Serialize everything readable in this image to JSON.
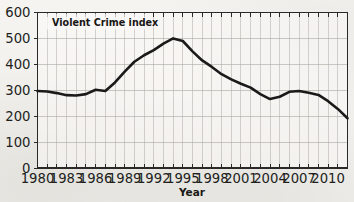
{
  "chart_data": {
    "type": "line",
    "title": "Violent Crime index",
    "xlabel": "Year",
    "ylabel": "",
    "xlim": [
      1980,
      2012
    ],
    "ylim": [
      0,
      600
    ],
    "grid": true,
    "legend_position": "inside-top-left",
    "y_ticks": [
      "0",
      "100",
      "200",
      "300",
      "400",
      "500",
      "600"
    ],
    "y_tick_values": [
      0,
      100,
      200,
      300,
      400,
      500,
      600
    ],
    "x_ticks": [
      "1980",
      "1983",
      "1986",
      "1989",
      "1992",
      "1995",
      "1998",
      "2001",
      "2004",
      "2007",
      "2010"
    ],
    "x_tick_values": [
      1980,
      1983,
      1986,
      1989,
      1992,
      1995,
      1998,
      2001,
      2004,
      2007,
      2010
    ],
    "x_minor_interval": 1,
    "line_color": "#1a1a1a",
    "line_width_px": 2.6,
    "series": [
      {
        "name": "Violent Crime index",
        "x": [
          1980,
          1981,
          1982,
          1983,
          1984,
          1985,
          1986,
          1987,
          1988,
          1989,
          1990,
          1991,
          1992,
          1993,
          1994,
          1995,
          1996,
          1997,
          1998,
          1999,
          2000,
          2001,
          2002,
          2003,
          2004,
          2005,
          2006,
          2007,
          2008,
          2009,
          2010,
          2011,
          2012
        ],
        "values": [
          297,
          295,
          289,
          281,
          280,
          285,
          302,
          297,
          330,
          372,
          410,
          435,
          455,
          480,
          500,
          490,
          450,
          415,
          390,
          362,
          342,
          325,
          310,
          285,
          266,
          275,
          294,
          297,
          290,
          282,
          258,
          228,
          192
        ]
      }
    ]
  },
  "labels": {
    "series_title": "Violent Crime index",
    "x_axis_title": "Year"
  }
}
